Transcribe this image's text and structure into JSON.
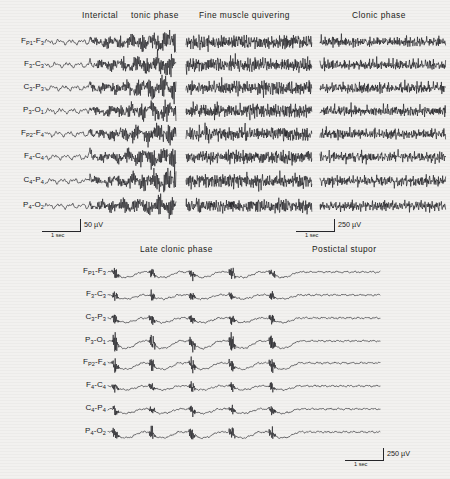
{
  "figure": {
    "background_color": "#f2f1ef",
    "trace_color": "#15151a",
    "montage_label": "longitudinal bipolar",
    "channels": [
      {
        "label": "F",
        "sub1": "P1",
        "sep": "-",
        "label2": "F",
        "sub2": "3",
        "text": "FP1-F3"
      },
      {
        "label": "F",
        "sub1": "3",
        "sep": "-",
        "label2": "C",
        "sub2": "3",
        "text": "F3-C3"
      },
      {
        "label": "C",
        "sub1": "3",
        "sep": "-",
        "label2": "P",
        "sub2": "3",
        "text": "C3-P3"
      },
      {
        "label": "P",
        "sub1": "3",
        "sep": "-",
        "label2": "O",
        "sub2": "1",
        "text": "P3-O1"
      },
      {
        "label": "F",
        "sub1": "P2",
        "sep": "-",
        "label2": "F",
        "sub2": "4",
        "text": "FP2-F4"
      },
      {
        "label": "F",
        "sub1": "4",
        "sep": "-",
        "label2": "C",
        "sub2": "4",
        "text": "F4-C4"
      },
      {
        "label": "C",
        "sub1": "4",
        "sep": "-",
        "label2": "P",
        "sub2": "4",
        "text": "C4-P4"
      },
      {
        "label": "P",
        "sub1": "4",
        "sep": "-",
        "label2": "O",
        "sub2": "2",
        "text": "P4-O2"
      }
    ],
    "top_row": {
      "titles": [
        {
          "text": "Interictal",
          "x": 82,
          "y": 12
        },
        {
          "text": "tonic phase",
          "x": 131,
          "y": 12
        },
        {
          "text": "Fine muscle quivering",
          "x": 199,
          "y": 12
        },
        {
          "text": "Clonic phase",
          "x": 352,
          "y": 12
        }
      ],
      "scalebars": [
        {
          "amplitude": "50 µV",
          "time": "1 sec",
          "x": 42,
          "y": 219,
          "length": 38
        },
        {
          "amplitude": "250 µV",
          "time": "1 sec",
          "x": 296,
          "y": 219,
          "length": 38
        }
      ]
    },
    "bottom_row": {
      "titles": [
        {
          "text": "Late clonic phase",
          "x": 140,
          "y": 246
        },
        {
          "text": "Postictal stupor",
          "x": 312,
          "y": 246
        }
      ],
      "scalebars": [
        {
          "amplitude": "250 µV",
          "time": "1 sec",
          "x": 345,
          "y": 448,
          "length": 38
        }
      ]
    }
  },
  "chart_data": {
    "type": "line",
    "xlabel": "time",
    "ylabel": "potential",
    "grid": false,
    "legend": "none",
    "panels": [
      {
        "name": "interictal-tonic",
        "titles": [
          "Interictal",
          "tonic phase"
        ],
        "x_range_px": [
          45,
          176
        ],
        "amplitude_scale": "50 µV",
        "time_scale": "1 sec",
        "segments": [
          {
            "phase": "Interictal",
            "x_from": 45,
            "x_to": 90,
            "amplitude": 2.0,
            "frequency": 9,
            "character": "low-voltage slow background"
          },
          {
            "phase": "tonic phase",
            "x_from": 90,
            "x_to": 176,
            "amplitude": 9.0,
            "frequency": 55,
            "character": "high-frequency recruiting rhythm building in amplitude"
          }
        ]
      },
      {
        "name": "fine-muscle-quivering",
        "titles": [
          "Fine muscle quivering"
        ],
        "x_range_px": [
          186,
          312
        ],
        "amplitude_scale": "250 µV",
        "time_scale": "1 sec",
        "segments": [
          {
            "phase": "Fine muscle quivering",
            "x_from": 186,
            "x_to": 312,
            "amplitude": 10.5,
            "frequency": 95,
            "character": "dense continuous EMG artefact, spiky"
          }
        ]
      },
      {
        "name": "clonic-phase",
        "titles": [
          "Clonic phase"
        ],
        "x_range_px": [
          320,
          446
        ],
        "amplitude_scale": "250 µV",
        "time_scale": "1 sec",
        "segments": [
          {
            "phase": "Clonic phase",
            "x_from": 320,
            "x_to": 446,
            "amplitude": 8.5,
            "frequency": 22,
            "character": "rhythmic bursts alternating with brief suppression"
          }
        ]
      },
      {
        "name": "late-clonic-postictal",
        "titles": [
          "Late clonic phase",
          "Postictal stupor"
        ],
        "x_range_px": [
          108,
          380
        ],
        "amplitude_scale": "250 µV",
        "time_scale": "1 sec",
        "segments": [
          {
            "phase": "Late clonic phase",
            "x_from": 108,
            "x_to": 285,
            "amplitude": 12.0,
            "frequency": 1.4,
            "character": "periodic polyspike-and-slow-wave complexes"
          },
          {
            "phase": "Postictal stupor",
            "x_from": 285,
            "x_to": 380,
            "amplitude": 1.6,
            "frequency": 5,
            "character": "flat, markedly suppressed background"
          }
        ]
      }
    ],
    "burst_positions_px": [
      115,
      152,
      192,
      232,
      272
    ],
    "channel_count": 8,
    "channels": [
      "FP1-F3",
      "F3-C3",
      "C3-P3",
      "P3-O1",
      "FP2-F4",
      "F4-C4",
      "C4-P4",
      "P4-O2"
    ],
    "top_row_y_px": [
      42,
      65,
      88,
      111,
      134,
      157,
      181,
      206
    ],
    "bottom_row_y_px": [
      272,
      295,
      318,
      341,
      363,
      386,
      409,
      432
    ]
  }
}
